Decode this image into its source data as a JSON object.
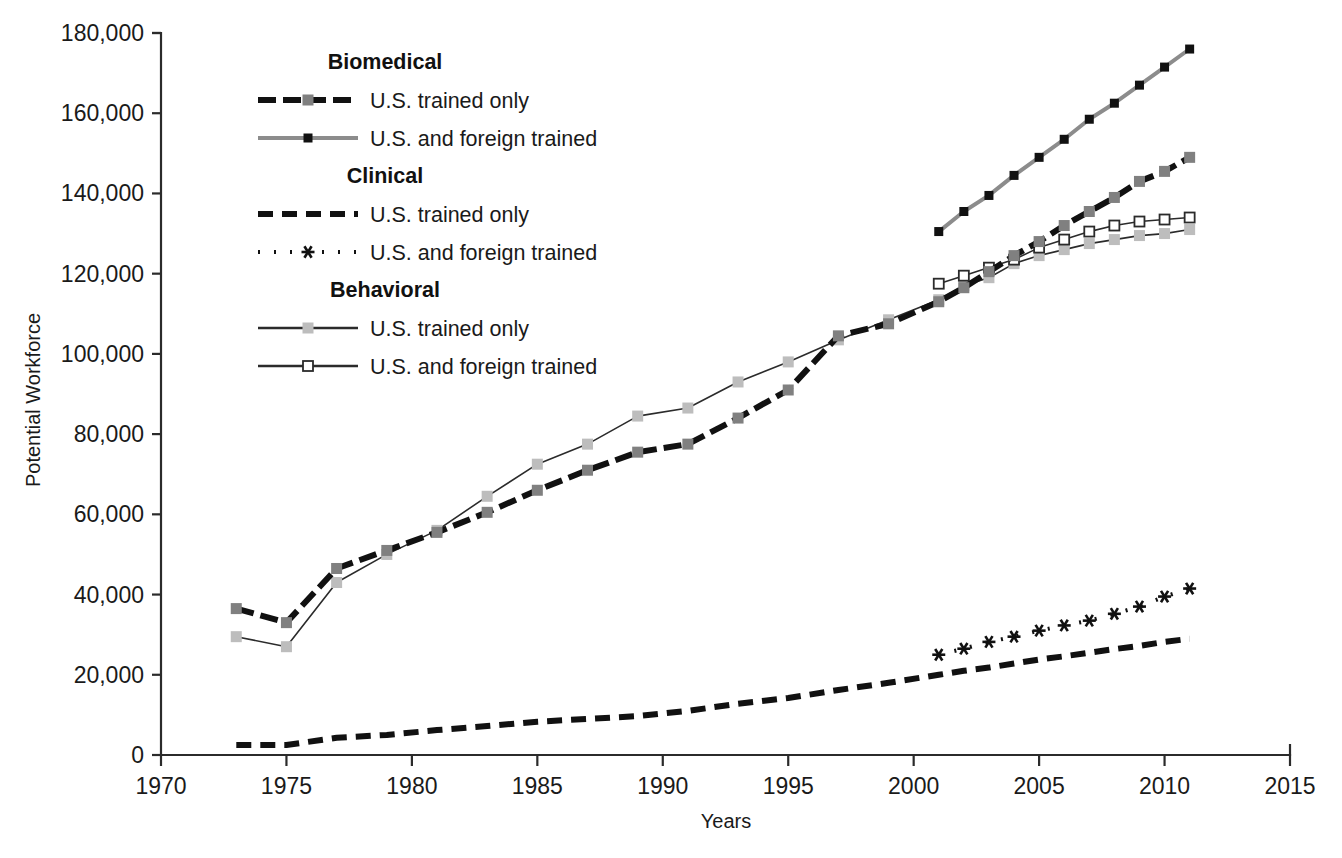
{
  "chart_data": {
    "type": "line",
    "title": "",
    "xlabel": "Years",
    "ylabel": "Potential Workforce",
    "xlim": [
      1970,
      2015
    ],
    "ylim": [
      0,
      180000
    ],
    "grid": false,
    "legend_position": "inside-top-left",
    "x_ticks": [
      "1970",
      "1975",
      "1980",
      "1985",
      "1990",
      "1995",
      "2000",
      "2005",
      "2010",
      "2015"
    ],
    "x_tick_values": [
      1970,
      1975,
      1980,
      1985,
      1990,
      1995,
      2000,
      2005,
      2010,
      2015
    ],
    "y_ticks": [
      "0",
      "20,000",
      "40,000",
      "60,000",
      "80,000",
      "100,000",
      "120,000",
      "140,000",
      "160,000",
      "180,000"
    ],
    "y_tick_values": [
      0,
      20000,
      40000,
      60000,
      80000,
      100000,
      120000,
      140000,
      160000,
      180000
    ],
    "series": [
      {
        "name": "Biomedical U.S. trained only",
        "group": "Biomedical",
        "label": "U.S. trained only",
        "color": "#111111",
        "marker": "square",
        "marker_color": "#808080",
        "marker_size": 11,
        "dash": "18,7",
        "width": 6,
        "x": [
          1973,
          1975,
          1977,
          1979,
          1981,
          1983,
          1985,
          1987,
          1989,
          1991,
          1993,
          1995,
          1997,
          1999,
          2001,
          2002,
          2003,
          2004,
          2005,
          2006,
          2007,
          2008,
          2009,
          2010,
          2011
        ],
        "values": [
          36500,
          33000,
          46500,
          51000,
          55500,
          60500,
          66000,
          71000,
          75500,
          77500,
          84000,
          91000,
          104500,
          107500,
          113000,
          116500,
          120500,
          124500,
          128000,
          132000,
          135500,
          139000,
          143000,
          145500,
          149000
        ]
      },
      {
        "name": "Biomedical U.S. and foreign trained",
        "group": "Biomedical",
        "label": "U.S. and foreign trained",
        "color": "#8c8c8c",
        "marker": "square",
        "marker_color": "#111111",
        "marker_size": 9,
        "dash": "0",
        "width": 4,
        "x": [
          2001,
          2002,
          2003,
          2004,
          2005,
          2006,
          2007,
          2008,
          2009,
          2010,
          2011
        ],
        "values": [
          130500,
          135500,
          139500,
          144500,
          149000,
          153500,
          158500,
          162500,
          167000,
          171500,
          176000
        ]
      },
      {
        "name": "Clinical U.S. trained only",
        "group": "Clinical",
        "label": "U.S. trained only",
        "color": "#111111",
        "marker": "none",
        "marker_color": "#111111",
        "marker_size": 0,
        "dash": "15,9",
        "width": 6,
        "x": [
          1973,
          1975,
          1977,
          1979,
          1981,
          1983,
          1985,
          1987,
          1989,
          1991,
          1993,
          1995,
          1997,
          1999,
          2001,
          2002,
          2003,
          2004,
          2005,
          2006,
          2007,
          2008,
          2009,
          2010,
          2011
        ],
        "values": [
          2500,
          2500,
          4300,
          5000,
          6200,
          7200,
          8300,
          9000,
          9700,
          11000,
          12800,
          14200,
          16200,
          18000,
          20000,
          21000,
          21800,
          22800,
          23800,
          24600,
          25500,
          26400,
          27200,
          28200,
          29000
        ]
      },
      {
        "name": "Clinical U.S. and foreign trained",
        "group": "Clinical",
        "label": "U.S. and foreign trained",
        "color": "#111111",
        "marker": "asterisk",
        "marker_color": "#111111",
        "marker_size": 13,
        "dash": "2,14",
        "width": 4,
        "x": [
          2001,
          2002,
          2003,
          2004,
          2005,
          2006,
          2007,
          2008,
          2009,
          2010,
          2011
        ],
        "values": [
          25000,
          26500,
          28200,
          29500,
          31000,
          32300,
          33500,
          35200,
          37000,
          39500,
          41500
        ]
      },
      {
        "name": "Behavioral U.S. trained only",
        "group": "Behavioral",
        "label": "U.S. trained only",
        "color": "#2b2b2b",
        "marker": "square",
        "marker_color": "#bdbdbd",
        "marker_size": 11,
        "dash": "0",
        "width": 1.6,
        "x": [
          1973,
          1975,
          1977,
          1979,
          1981,
          1983,
          1985,
          1987,
          1989,
          1991,
          1993,
          1995,
          1997,
          1999,
          2001,
          2002,
          2003,
          2004,
          2005,
          2006,
          2007,
          2008,
          2009,
          2010,
          2011
        ],
        "values": [
          29500,
          27000,
          43000,
          50000,
          56000,
          64500,
          72500,
          77500,
          84500,
          86500,
          93000,
          98000,
          103500,
          108500,
          113500,
          117000,
          119000,
          122500,
          124500,
          126000,
          127500,
          128500,
          129500,
          130000,
          131000
        ]
      },
      {
        "name": "Behavioral U.S. and foreign trained",
        "group": "Behavioral",
        "label": "U.S. and foreign trained",
        "color": "#2b2b2b",
        "marker": "square-open",
        "marker_color": "#ffffff",
        "marker_size": 10,
        "dash": "0",
        "width": 1.6,
        "x": [
          2001,
          2002,
          2003,
          2004,
          2005,
          2006,
          2007,
          2008,
          2009,
          2010,
          2011
        ],
        "values": [
          117500,
          119500,
          121500,
          123500,
          126500,
          128500,
          130500,
          132000,
          133000,
          133500,
          134000
        ]
      }
    ]
  },
  "legend": {
    "entries": [
      {
        "kind": "heading",
        "text": "Biomedical"
      },
      {
        "kind": "item",
        "text": "U.S. trained only",
        "series": 0
      },
      {
        "kind": "item",
        "text": "U.S. and foreign trained",
        "series": 1
      },
      {
        "kind": "heading",
        "text": "Clinical"
      },
      {
        "kind": "item",
        "text": "U.S. trained only",
        "series": 2
      },
      {
        "kind": "item",
        "text": "U.S. and foreign trained",
        "series": 3
      },
      {
        "kind": "heading",
        "text": "Behavioral"
      },
      {
        "kind": "item",
        "text": "U.S. trained only",
        "series": 4
      },
      {
        "kind": "item",
        "text": "U.S. and foreign trained",
        "series": 5
      }
    ]
  },
  "axes": {
    "y_title": "Potential Workforce",
    "x_title": "Years"
  }
}
